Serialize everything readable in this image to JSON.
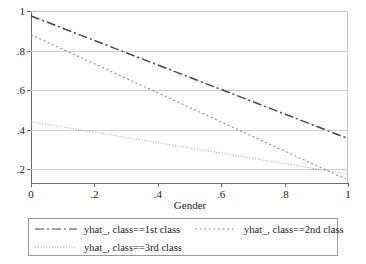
{
  "chart_data": {
    "type": "line",
    "title": "",
    "xlabel": "Gender",
    "ylabel": "",
    "xlim": [
      0,
      1
    ],
    "ylim": [
      0.13,
      1.0
    ],
    "grid": true,
    "legend_position": "bottom",
    "x_ticks": [
      "0",
      ".2",
      ".4",
      ".6",
      ".8",
      "1"
    ],
    "x_tick_values": [
      0,
      0.2,
      0.4,
      0.6,
      0.8,
      1
    ],
    "y_ticks": [
      "1",
      ".8",
      ".6",
      ".4",
      ".2"
    ],
    "y_tick_values": [
      1,
      0.8,
      0.6,
      0.4,
      0.2
    ],
    "x": [
      0,
      1
    ],
    "series": [
      {
        "name": "yhat_, class==1st class",
        "values": [
          0.975,
          0.355
        ],
        "style": "dash-dot",
        "color": "#4a4a4a"
      },
      {
        "name": "yhat_, class==2nd class",
        "values": [
          0.88,
          0.145
        ],
        "style": "dotted",
        "color": "#8a8a8a"
      },
      {
        "name": "yhat_, class==3rd class",
        "values": [
          0.44,
          0.175
        ],
        "style": "fine-dotted",
        "color": "#a0a0a0"
      }
    ]
  },
  "axes": {
    "x_title": "Gender"
  },
  "legend": {
    "entries": [
      {
        "label": "yhat_, class==1st class"
      },
      {
        "label": "yhat_, class==2nd class"
      },
      {
        "label": "yhat_, class==3rd class"
      }
    ]
  },
  "colors": {
    "series1": "#4a4a4a",
    "series2": "#8a8a8a",
    "series3": "#a0a0a0",
    "gridline": "#cfcfcf",
    "axis": "#6e6e6e",
    "frame": "#c8c8c8",
    "legend_border": "#9a9a9a",
    "background": "#ffffff"
  }
}
